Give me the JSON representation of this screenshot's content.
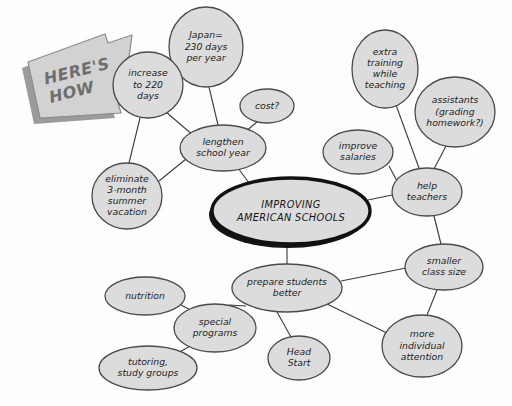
{
  "diagram": {
    "type": "mind-map",
    "banner": {
      "line1": "HERE'S",
      "line2": "HOW",
      "shape": "right-arrow-banner"
    },
    "colors": {
      "node_fill": "#dcdcdc",
      "node_stroke": "#4a4a4a",
      "center_stroke": "#111111",
      "edge": "#3b3b3b",
      "banner_fill": "#d2d2d2",
      "banner_shadow": "#9b9b9b",
      "banner_text": "#6e6e6e",
      "background": "#fdfdfd"
    },
    "center": {
      "id": "center",
      "lines": [
        "IMPROVING",
        "AMERICAN SCHOOLS"
      ],
      "cx": 291,
      "cy": 211,
      "rx": 79,
      "ry": 33
    },
    "nodes": [
      {
        "id": "japan",
        "lines": [
          "Japan=",
          "230 days",
          "per year"
        ],
        "cx": 206,
        "cy": 47,
        "rx": 37,
        "ry": 40
      },
      {
        "id": "increase-220",
        "lines": [
          "increase",
          "to 220",
          "days"
        ],
        "cx": 148,
        "cy": 85,
        "rx": 35,
        "ry": 33
      },
      {
        "id": "cost",
        "lines": [
          "cost?"
        ],
        "cx": 267,
        "cy": 106,
        "rx": 27,
        "ry": 17
      },
      {
        "id": "lengthen",
        "lines": [
          "lengthen",
          "school year"
        ],
        "cx": 223,
        "cy": 148,
        "rx": 43,
        "ry": 23
      },
      {
        "id": "eliminate",
        "lines": [
          "eliminate",
          "3-month",
          "summer",
          "vacation"
        ],
        "cx": 127,
        "cy": 196,
        "rx": 35,
        "ry": 33
      },
      {
        "id": "extra-training",
        "lines": [
          "extra",
          "training",
          "while",
          "teaching"
        ],
        "cx": 385,
        "cy": 69,
        "rx": 33,
        "ry": 39
      },
      {
        "id": "assistants",
        "lines": [
          "assistants",
          "(grading",
          "homework?)"
        ],
        "cx": 455,
        "cy": 112,
        "rx": 40,
        "ry": 35
      },
      {
        "id": "improve-salaries",
        "lines": [
          "improve",
          "salaries"
        ],
        "cx": 358,
        "cy": 152,
        "rx": 35,
        "ry": 22
      },
      {
        "id": "help-teachers",
        "lines": [
          "help",
          "teachers"
        ],
        "cx": 427,
        "cy": 192,
        "rx": 35,
        "ry": 24
      },
      {
        "id": "smaller-class",
        "lines": [
          "smaller",
          "class size"
        ],
        "cx": 444,
        "cy": 267,
        "rx": 39,
        "ry": 23
      },
      {
        "id": "prepare-students",
        "lines": [
          "prepare students",
          "better"
        ],
        "cx": 287,
        "cy": 288,
        "rx": 55,
        "ry": 24
      },
      {
        "id": "more-individual",
        "lines": [
          "more",
          "individual",
          "attention"
        ],
        "cx": 422,
        "cy": 346,
        "rx": 40,
        "ry": 31
      },
      {
        "id": "nutrition",
        "lines": [
          "nutrition"
        ],
        "cx": 145,
        "cy": 296,
        "rx": 40,
        "ry": 19
      },
      {
        "id": "special-programs",
        "lines": [
          "special",
          "programs"
        ],
        "cx": 215,
        "cy": 328,
        "rx": 41,
        "ry": 24
      },
      {
        "id": "tutoring",
        "lines": [
          "tutoring,",
          "study groups"
        ],
        "cx": 148,
        "cy": 368,
        "rx": 49,
        "ry": 22
      },
      {
        "id": "head-start",
        "lines": [
          "Head",
          "Start"
        ],
        "cx": 299,
        "cy": 358,
        "rx": 31,
        "ry": 22
      }
    ],
    "edges": [
      {
        "from": "japan",
        "to": "lengthen",
        "x1": 209,
        "y1": 87,
        "x2": 218,
        "y2": 125
      },
      {
        "from": "increase-220",
        "to": "lengthen",
        "x1": 166,
        "y1": 112,
        "x2": 194,
        "y2": 136
      },
      {
        "from": "increase-220",
        "to": "eliminate",
        "x1": 140,
        "y1": 118,
        "x2": 129,
        "y2": 163
      },
      {
        "from": "cost",
        "to": "lengthen",
        "x1": 258,
        "y1": 121,
        "x2": 244,
        "y2": 133
      },
      {
        "from": "eliminate",
        "to": "lengthen",
        "x1": 159,
        "y1": 181,
        "x2": 186,
        "y2": 159
      },
      {
        "from": "lengthen",
        "to": "center",
        "x1": 238,
        "y1": 168,
        "x2": 252,
        "y2": 187
      },
      {
        "from": "extra-training",
        "to": "help-teachers",
        "x1": 396,
        "y1": 105,
        "x2": 419,
        "y2": 168
      },
      {
        "from": "assistants",
        "to": "help-teachers",
        "x1": 446,
        "y1": 146,
        "x2": 434,
        "y2": 169
      },
      {
        "from": "improve-salaries",
        "to": "help-teachers",
        "x1": 389,
        "y1": 166,
        "x2": 397,
        "y2": 181
      },
      {
        "from": "center",
        "to": "help-teachers",
        "x1": 368,
        "y1": 200,
        "x2": 392,
        "y2": 195
      },
      {
        "from": "help-teachers",
        "to": "smaller-class",
        "x1": 434,
        "y1": 216,
        "x2": 441,
        "y2": 244
      },
      {
        "from": "center",
        "to": "prepare-students",
        "x1": 287,
        "y1": 244,
        "x2": 287,
        "y2": 264
      },
      {
        "from": "prepare-students",
        "to": "smaller-class",
        "x1": 341,
        "y1": 281,
        "x2": 406,
        "y2": 268
      },
      {
        "from": "smaller-class",
        "to": "more-individual",
        "x1": 437,
        "y1": 290,
        "x2": 427,
        "y2": 315
      },
      {
        "from": "prepare-students",
        "to": "more-individual",
        "x1": 327,
        "y1": 304,
        "x2": 389,
        "y2": 334
      },
      {
        "from": "prepare-students",
        "to": "special-programs",
        "x1": 246,
        "y1": 306,
        "x2": 229,
        "y2": 305
      },
      {
        "from": "prepare-students",
        "to": "head-start",
        "x1": 277,
        "y1": 312,
        "x2": 291,
        "y2": 337
      },
      {
        "from": "nutrition",
        "to": "special-programs",
        "x1": 181,
        "y1": 305,
        "x2": 196,
        "y2": 313
      },
      {
        "from": "special-programs",
        "to": "tutoring",
        "x1": 192,
        "y1": 345,
        "x2": 176,
        "y2": 354
      }
    ]
  }
}
